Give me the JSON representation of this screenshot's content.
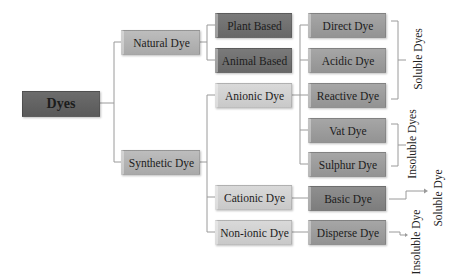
{
  "diagram": {
    "root": "Dyes",
    "level1": {
      "natural": "Natural Dye",
      "synthetic": "Synthetic Dye"
    },
    "natural_children": [
      "Plant Based",
      "Animal Based"
    ],
    "synthetic_children": [
      "Anionic Dye",
      "Cationic Dye",
      "Non-ionic Dye"
    ],
    "anionic_children": [
      "Direct Dye",
      "Acidic Dye",
      "Reactive Dye",
      "Vat Dye",
      "Sulphur Dye"
    ],
    "cationic_children": [
      "Basic Dye"
    ],
    "nonionic_children": [
      "Disperse Dye"
    ],
    "groups": {
      "soluble_dyes": "Soluble Dyes",
      "insoluble_dyes": "Insoluble Dyes",
      "soluble_dye": "Soluble Dye",
      "insoluble_dye": "Insoluble Dye"
    }
  }
}
